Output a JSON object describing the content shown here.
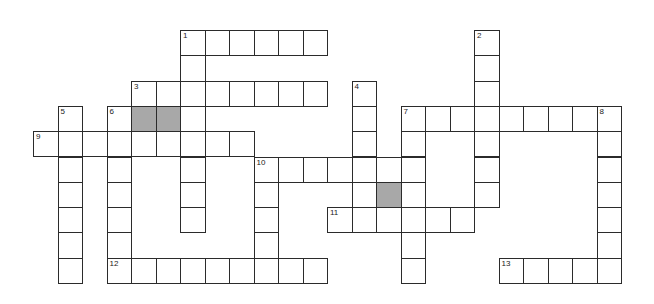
{
  "puzzle": {
    "rows": 10,
    "cols": 24,
    "origin_x": 33,
    "origin_y": 30,
    "pitch_x": 24.5,
    "pitch_y": 25.3,
    "colors": {
      "border": "#2b2b2b",
      "cell": "#ffffff",
      "shaded": "#a8a8a8"
    },
    "cells": [
      [
        0,
        6
      ],
      [
        0,
        7
      ],
      [
        0,
        8
      ],
      [
        0,
        9
      ],
      [
        0,
        10
      ],
      [
        0,
        11
      ],
      [
        0,
        18
      ],
      [
        1,
        6
      ],
      [
        1,
        18
      ],
      [
        2,
        4
      ],
      [
        2,
        5
      ],
      [
        2,
        6
      ],
      [
        2,
        7
      ],
      [
        2,
        8
      ],
      [
        2,
        9
      ],
      [
        2,
        10
      ],
      [
        2,
        11
      ],
      [
        2,
        13
      ],
      [
        2,
        18
      ],
      [
        3,
        1
      ],
      [
        3,
        3
      ],
      [
        3,
        6
      ],
      [
        3,
        13
      ],
      [
        3,
        15
      ],
      [
        3,
        16
      ],
      [
        3,
        17
      ],
      [
        3,
        18
      ],
      [
        3,
        19
      ],
      [
        3,
        20
      ],
      [
        3,
        21
      ],
      [
        3,
        22
      ],
      [
        3,
        23
      ],
      [
        4,
        0
      ],
      [
        4,
        1
      ],
      [
        4,
        2
      ],
      [
        4,
        3
      ],
      [
        4,
        4
      ],
      [
        4,
        5
      ],
      [
        4,
        6
      ],
      [
        4,
        7
      ],
      [
        4,
        8
      ],
      [
        4,
        13
      ],
      [
        4,
        15
      ],
      [
        4,
        18
      ],
      [
        4,
        23
      ],
      [
        5,
        1
      ],
      [
        5,
        3
      ],
      [
        5,
        6
      ],
      [
        5,
        9
      ],
      [
        5,
        10
      ],
      [
        5,
        11
      ],
      [
        5,
        12
      ],
      [
        5,
        13
      ],
      [
        5,
        14
      ],
      [
        5,
        15
      ],
      [
        5,
        18
      ],
      [
        5,
        23
      ],
      [
        6,
        1
      ],
      [
        6,
        3
      ],
      [
        6,
        6
      ],
      [
        6,
        9
      ],
      [
        6,
        13
      ],
      [
        6,
        15
      ],
      [
        6,
        18
      ],
      [
        6,
        23
      ],
      [
        7,
        1
      ],
      [
        7,
        3
      ],
      [
        7,
        6
      ],
      [
        7,
        9
      ],
      [
        7,
        12
      ],
      [
        7,
        13
      ],
      [
        7,
        14
      ],
      [
        7,
        15
      ],
      [
        7,
        16
      ],
      [
        7,
        17
      ],
      [
        7,
        23
      ],
      [
        8,
        1
      ],
      [
        8,
        3
      ],
      [
        8,
        9
      ],
      [
        8,
        15
      ],
      [
        8,
        23
      ],
      [
        9,
        1
      ],
      [
        9,
        3
      ],
      [
        9,
        4
      ],
      [
        9,
        5
      ],
      [
        9,
        6
      ],
      [
        9,
        7
      ],
      [
        9,
        8
      ],
      [
        9,
        9
      ],
      [
        9,
        10
      ],
      [
        9,
        11
      ],
      [
        9,
        15
      ],
      [
        9,
        19
      ],
      [
        9,
        20
      ],
      [
        9,
        21
      ],
      [
        9,
        22
      ],
      [
        9,
        23
      ]
    ],
    "shaded": [
      [
        3,
        4
      ],
      [
        3,
        5
      ],
      [
        6,
        14
      ]
    ],
    "numbers": [
      {
        "label": "1",
        "row": 0,
        "col": 6
      },
      {
        "label": "2",
        "row": 0,
        "col": 18
      },
      {
        "label": "3",
        "row": 2,
        "col": 4
      },
      {
        "label": "4",
        "row": 2,
        "col": 13
      },
      {
        "label": "5",
        "row": 3,
        "col": 1
      },
      {
        "label": "6",
        "row": 3,
        "col": 3
      },
      {
        "label": "7",
        "row": 3,
        "col": 15
      },
      {
        "label": "8",
        "row": 3,
        "col": 23
      },
      {
        "label": "9",
        "row": 4,
        "col": 0
      },
      {
        "label": "10",
        "row": 5,
        "col": 9
      },
      {
        "label": "11",
        "row": 7,
        "col": 12
      },
      {
        "label": "12",
        "row": 9,
        "col": 3
      },
      {
        "label": "13",
        "row": 9,
        "col": 19
      }
    ],
    "entries": {
      "across": [
        {
          "number": "1",
          "row": 0,
          "col": 6,
          "length": 6
        },
        {
          "number": "3",
          "row": 2,
          "col": 4,
          "length": 8
        },
        {
          "number": "7",
          "row": 3,
          "col": 15,
          "length": 9
        },
        {
          "number": "9",
          "row": 4,
          "col": 0,
          "length": 9
        },
        {
          "number": "10",
          "row": 5,
          "col": 9,
          "length": 7
        },
        {
          "number": "11",
          "row": 7,
          "col": 12,
          "length": 6
        },
        {
          "number": "12",
          "row": 9,
          "col": 3,
          "length": 9
        },
        {
          "number": "13",
          "row": 9,
          "col": 19,
          "length": 5
        }
      ],
      "down": [
        {
          "number": "1",
          "row": 0,
          "col": 6,
          "length": 8
        },
        {
          "number": "2",
          "row": 0,
          "col": 18,
          "length": 7
        },
        {
          "number": "4",
          "row": 2,
          "col": 13,
          "length": 6
        },
        {
          "number": "5",
          "row": 3,
          "col": 1,
          "length": 7
        },
        {
          "number": "6",
          "row": 3,
          "col": 3,
          "length": 7
        },
        {
          "number": "7",
          "row": 3,
          "col": 15,
          "length": 7
        },
        {
          "number": "8",
          "row": 3,
          "col": 23,
          "length": 7
        },
        {
          "number": "10",
          "row": 5,
          "col": 9,
          "length": 5
        }
      ]
    }
  }
}
